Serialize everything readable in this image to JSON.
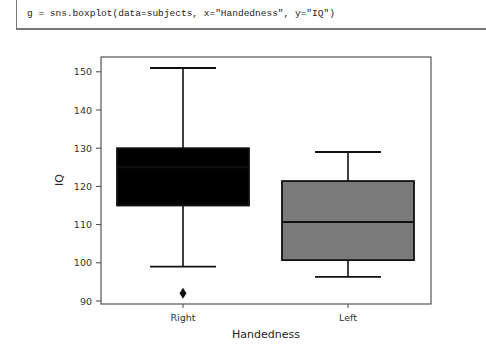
{
  "code_cell": {
    "code": "g = sns.boxplot(data=subjects, x=\"Handedness\", y=\"IQ\")"
  },
  "chart_data": {
    "type": "boxplot",
    "title": "",
    "xlabel": "Handedness",
    "ylabel": "IQ",
    "categories": [
      "Right",
      "Left"
    ],
    "ylim": [
      89.5,
      152.5
    ],
    "yticks": [
      90,
      100,
      110,
      120,
      130,
      140,
      150
    ],
    "ytick_labels": [
      "90",
      "100",
      "110",
      "120",
      "130",
      "140",
      "150"
    ],
    "grid": false,
    "legend": null,
    "series": [
      {
        "name": "Right",
        "whisker_low": 99,
        "q1": 115,
        "median": 125,
        "q3": 130,
        "whisker_high": 151,
        "outliers": [
          92
        ],
        "fill": "#000000"
      },
      {
        "name": "Left",
        "whisker_low": 96.3,
        "q1": 100.7,
        "median": 110.7,
        "q3": 121.4,
        "whisker_high": 129,
        "outliers": [],
        "fill": "#7a7a7a"
      }
    ]
  }
}
